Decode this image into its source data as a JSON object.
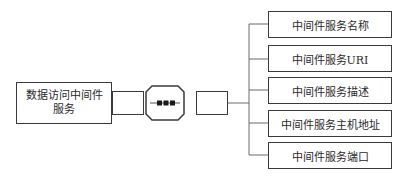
{
  "diagram": {
    "type": "structure",
    "main_node": {
      "label_line1": "数据访问中间件",
      "label_line2": "服务"
    },
    "connector": {
      "symbol": "•••"
    },
    "items": [
      {
        "label": "中间件服务名称"
      },
      {
        "label": "中间件服务URI"
      },
      {
        "label": "中间件服务描述"
      },
      {
        "label": "中间件服务主机地址"
      },
      {
        "label": "中间件服务端口"
      }
    ],
    "colors": {
      "stroke": "#3a3a3a",
      "line": "#6a6a6a",
      "background": "#ffffff"
    }
  }
}
